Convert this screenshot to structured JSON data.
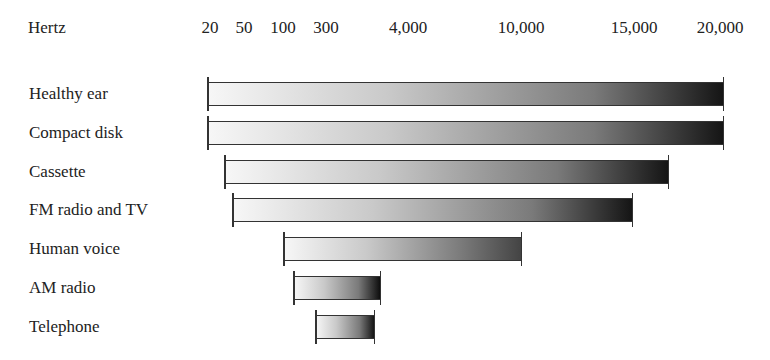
{
  "chart_data": {
    "type": "bar",
    "orientation": "horizontal-range",
    "title": "",
    "xlabel": "Hertz",
    "ylabel": "",
    "x_tick_labels": [
      "20",
      "50",
      "100",
      "300",
      "4,000",
      "10,000",
      "15,000",
      "20,000"
    ],
    "categories": [
      "Healthy ear",
      "Compact disk",
      "Cassette",
      "FM radio and TV",
      "Human voice",
      "AM radio",
      "Telephone"
    ],
    "series": [
      {
        "name": "Frequency range (Hz)",
        "ranges": [
          {
            "category": "Healthy ear",
            "low": 20,
            "high": 20000
          },
          {
            "category": "Compact disk",
            "low": 20,
            "high": 20000
          },
          {
            "category": "Cassette",
            "low": 40,
            "high": 16000
          },
          {
            "category": "FM radio and TV",
            "low": 50,
            "high": 15000
          },
          {
            "category": "Human voice",
            "low": 100,
            "high": 10000
          },
          {
            "category": "AM radio",
            "low": 100,
            "high": 4000
          },
          {
            "category": "Telephone",
            "low": 300,
            "high": 3500
          }
        ]
      }
    ],
    "grid": false,
    "legend": "none",
    "fill": "gradient light-gray to black"
  },
  "axis": {
    "unit_label": "Hertz",
    "ticks": [
      {
        "label": "20",
        "x": 210
      },
      {
        "label": "50",
        "x": 244
      },
      {
        "label": "100",
        "x": 283
      },
      {
        "label": "300",
        "x": 326
      },
      {
        "label": "4,000",
        "x": 408
      },
      {
        "label": "10,000",
        "x": 521
      },
      {
        "label": "15,000",
        "x": 634
      },
      {
        "label": "20,000",
        "x": 720
      }
    ]
  },
  "rows": [
    {
      "label": "Healthy ear",
      "x1": 208,
      "x2": 723,
      "y": 82,
      "dark": "#151515"
    },
    {
      "label": "Compact disk",
      "x1": 208,
      "x2": 723,
      "y": 121,
      "dark": "#151515"
    },
    {
      "label": "Cassette",
      "x1": 225,
      "x2": 668,
      "y": 160,
      "dark": "#151515"
    },
    {
      "label": "FM radio and TV",
      "x1": 233,
      "x2": 632,
      "y": 198,
      "dark": "#151515"
    },
    {
      "label": "Human voice",
      "x1": 284,
      "x2": 521,
      "y": 237,
      "dark": "#444444"
    },
    {
      "label": "AM radio",
      "x1": 294,
      "x2": 380,
      "y": 276,
      "dark": "#0e0e0e"
    },
    {
      "label": "Telephone",
      "x1": 316,
      "x2": 374,
      "y": 315,
      "dark": "#151515"
    }
  ]
}
